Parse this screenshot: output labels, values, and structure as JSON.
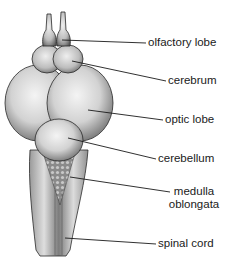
{
  "figure": {
    "labels": [
      {
        "id": "olfactory-lobe",
        "text": "olfactory lobe"
      },
      {
        "id": "cerebrum",
        "text": "cerebrum"
      },
      {
        "id": "optic-lobe",
        "text": "optic lobe"
      },
      {
        "id": "cerebellum",
        "text": "cerebellum"
      },
      {
        "id": "medulla-oblongata",
        "line1": "medulla",
        "line2": "oblongata"
      },
      {
        "id": "spinal-cord",
        "text": "spinal cord"
      }
    ],
    "caption_partial": "",
    "colors": {
      "ink": "#1a1a1a",
      "shade": "#6a6a6a",
      "paper": "#ffffff"
    }
  }
}
